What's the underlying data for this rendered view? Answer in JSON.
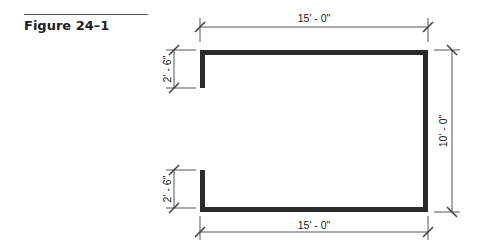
{
  "figure": {
    "title": "Figure 24–1"
  },
  "drawing": {
    "wall_color": "#2a2a2a",
    "dimension_color": "#444444",
    "dimensions": {
      "top_width": "15' - 0\"",
      "bottom_width": "15' - 0\"",
      "right_height": "10' - 0\"",
      "left_top_segment": "2' - 6\"",
      "left_bottom_segment": "2' - 6\""
    }
  }
}
